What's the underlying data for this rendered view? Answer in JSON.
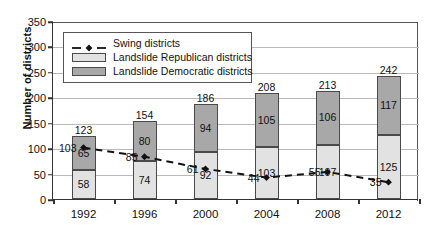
{
  "chart_data": {
    "type": "bar",
    "subtype": "stacked-bar-with-line-overlay",
    "title": "",
    "xlabel": "",
    "ylabel": "Number of districts",
    "categories": [
      "1992",
      "1996",
      "2000",
      "2004",
      "2008",
      "2012"
    ],
    "ylim": [
      0,
      350
    ],
    "yticks": [
      0,
      50,
      100,
      150,
      200,
      250,
      300,
      350
    ],
    "grid": true,
    "legend_position": "upper-left-inside",
    "series": [
      {
        "name": "Swing districts",
        "type": "line",
        "style": "dashed",
        "marker": "diamond",
        "color": "#111111",
        "values": [
          103,
          85,
          61,
          44,
          55,
          35
        ]
      },
      {
        "name": "Landslide Republican districts",
        "type": "bar-segment",
        "stack_position": "bottom",
        "color": "#e2e2e2",
        "values": [
          58,
          74,
          92,
          103,
          107,
          125
        ]
      },
      {
        "name": "Landslide Democratic districts",
        "type": "bar-segment",
        "stack_position": "top",
        "color": "#a8a8a8",
        "values": [
          65,
          80,
          94,
          105,
          106,
          117
        ]
      }
    ],
    "bar_totals": [
      123,
      154,
      186,
      208,
      213,
      242
    ],
    "annotations": {
      "total_labels_above_bars": [
        "123",
        "154",
        "186",
        "208",
        "213",
        "242"
      ],
      "republican_segment_labels": [
        "58",
        "74",
        "92",
        "103",
        "107",
        "125"
      ],
      "democratic_segment_labels": [
        "65",
        "80",
        "94",
        "105",
        "106",
        "117"
      ],
      "swing_point_labels": [
        "103",
        "85",
        "61",
        "44",
        "55",
        "35"
      ]
    }
  },
  "axes": {
    "y_title": "Number of districts",
    "y_tick_labels": [
      "350",
      "300",
      "250",
      "200",
      "150",
      "100",
      "50",
      "0"
    ],
    "x_tick_labels": [
      "1992",
      "1996",
      "2000",
      "2004",
      "2008",
      "2012"
    ]
  },
  "legend": {
    "entries": [
      {
        "label": "Swing districts",
        "key": "dashed-line-with-diamond-marker"
      },
      {
        "label": "Landslide Republican districts",
        "key": "light-gray-swatch"
      },
      {
        "label": "Landslide Democratic districts",
        "key": "dark-gray-swatch"
      }
    ]
  },
  "colors": {
    "republican_fill": "#e2e2e2",
    "democratic_fill": "#a8a8a8",
    "segment_border": "#4a4a4a",
    "swing_line": "#111111",
    "gridline": "#b9b9b9",
    "axis": "#333333"
  }
}
